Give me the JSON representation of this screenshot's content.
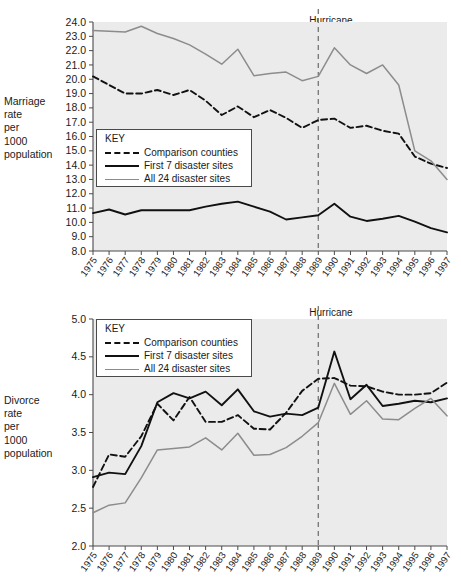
{
  "page": {
    "background": "#ffffff",
    "plot_background": "#ebebeb",
    "axis_color": "#4a4a4a"
  },
  "legend": {
    "title": "KEY",
    "entries": [
      {
        "label": "Comparison counties",
        "style": "dashed",
        "color": "#111111"
      },
      {
        "label": "First 7 disaster sites",
        "style": "solid",
        "color": "#111111"
      },
      {
        "label": "All 24 disaster sites",
        "style": "solid",
        "color": "#8c8c8c"
      }
    ]
  },
  "annotation": {
    "hugo_line1": "Hurricane",
    "hugo_line2": "Hugo",
    "hugo_year": 1989
  },
  "axis_titles": {
    "marriage": "Marriage\nrate\nper\n1000\npopulation",
    "divorce": "Divorce\nrate\nper\n1000\npopulation"
  },
  "chart_data": [
    {
      "type": "line",
      "id": "marriage",
      "title": "",
      "xlabel": "",
      "ylabel": "Marriage rate per 1000 population",
      "xlim": [
        1975,
        1997
      ],
      "ylim": [
        8.0,
        24.0
      ],
      "ytick_step": 1.0,
      "grid": false,
      "legend_position": "inside-left",
      "x": [
        1975,
        1976,
        1977,
        1978,
        1979,
        1980,
        1981,
        1982,
        1983,
        1984,
        1985,
        1986,
        1987,
        1988,
        1989,
        1990,
        1991,
        1992,
        1993,
        1994,
        1995,
        1996,
        1997
      ],
      "xticklabels": [
        "1975",
        "1976",
        "1977",
        "1978",
        "1979",
        "1980",
        "1981",
        "1982",
        "1983",
        "1984",
        "1985",
        "1986",
        "1987",
        "1988",
        "1989",
        "1990",
        "1991",
        "1992",
        "1993",
        "1994",
        "1995",
        "1996",
        "1997"
      ],
      "yticklabels": [
        "8.0",
        "9.0",
        "10.0",
        "11.0",
        "12.0",
        "13.0",
        "14.0",
        "15.0",
        "16.0",
        "17.0",
        "18.0",
        "19.0",
        "20.0",
        "21.0",
        "22.0",
        "23.0",
        "24.0"
      ],
      "series": [
        {
          "name": "Comparison counties",
          "style": "dashed",
          "color": "#111111",
          "values": [
            20.2,
            19.6,
            19.0,
            19.0,
            19.25,
            18.9,
            19.25,
            18.5,
            17.5,
            18.1,
            17.35,
            17.85,
            17.3,
            16.6,
            17.15,
            17.25,
            16.6,
            16.75,
            16.4,
            16.2,
            14.6,
            14.1,
            13.8
          ]
        },
        {
          "name": "First 7 disaster sites",
          "style": "solid",
          "color": "#111111",
          "values": [
            10.65,
            10.9,
            10.55,
            10.85,
            10.85,
            10.85,
            10.85,
            11.1,
            11.3,
            11.45,
            11.1,
            10.75,
            10.2,
            10.35,
            10.5,
            11.3,
            10.4,
            10.1,
            10.25,
            10.45,
            10.05,
            9.6,
            9.3
          ]
        },
        {
          "name": "All 24 disaster sites",
          "style": "solid",
          "color": "#8c8c8c",
          "values": [
            23.4,
            23.35,
            23.3,
            23.7,
            23.2,
            22.85,
            22.4,
            21.75,
            21.05,
            22.1,
            20.25,
            20.4,
            20.5,
            19.9,
            20.2,
            22.2,
            21.0,
            20.4,
            21.0,
            19.6,
            15.0,
            14.3,
            13.0
          ]
        }
      ]
    },
    {
      "type": "line",
      "id": "divorce",
      "title": "",
      "xlabel": "",
      "ylabel": "Divorce rate per 1000 population",
      "xlim": [
        1975,
        1997
      ],
      "ylim": [
        2.0,
        5.0
      ],
      "ytick_step": 0.5,
      "grid": false,
      "legend_position": "inside-left-top",
      "x": [
        1975,
        1976,
        1977,
        1978,
        1979,
        1980,
        1981,
        1982,
        1983,
        1984,
        1985,
        1986,
        1987,
        1988,
        1989,
        1990,
        1991,
        1992,
        1993,
        1994,
        1995,
        1996,
        1997
      ],
      "xticklabels": [
        "1975",
        "1976",
        "1977",
        "1978",
        "1979",
        "1980",
        "1981",
        "1982",
        "1983",
        "1984",
        "1985",
        "1986",
        "1987",
        "1988",
        "1989",
        "1990",
        "1991",
        "1992",
        "1993",
        "1994",
        "1995",
        "1996",
        "1997"
      ],
      "yticklabels": [
        "2.0",
        "2.5",
        "3.0",
        "3.5",
        "4.0",
        "4.5",
        "5.0"
      ],
      "series": [
        {
          "name": "Comparison counties",
          "style": "dashed",
          "color": "#111111",
          "values": [
            2.78,
            3.21,
            3.18,
            3.45,
            3.88,
            3.66,
            3.97,
            3.64,
            3.64,
            3.73,
            3.55,
            3.54,
            3.76,
            4.05,
            4.21,
            4.22,
            4.12,
            4.11,
            4.04,
            4.0,
            4.0,
            4.02,
            4.16
          ]
        },
        {
          "name": "First 7 disaster sites",
          "style": "solid",
          "color": "#111111",
          "values": [
            2.91,
            2.97,
            2.95,
            3.32,
            3.9,
            4.02,
            3.95,
            4.04,
            3.86,
            4.07,
            3.78,
            3.71,
            3.75,
            3.73,
            3.83,
            4.57,
            3.94,
            4.13,
            3.85,
            3.88,
            3.92,
            3.9,
            3.95
          ]
        },
        {
          "name": "All 24 disaster sites",
          "style": "solid",
          "color": "#8c8c8c",
          "values": [
            2.44,
            2.54,
            2.57,
            2.9,
            3.27,
            3.29,
            3.31,
            3.43,
            3.27,
            3.49,
            3.2,
            3.21,
            3.3,
            3.45,
            3.63,
            4.15,
            3.74,
            3.92,
            3.68,
            3.67,
            3.82,
            3.95,
            3.72
          ]
        }
      ]
    }
  ]
}
